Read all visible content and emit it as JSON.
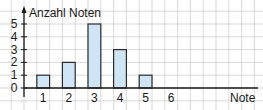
{
  "chart_data": {
    "type": "bar",
    "title": "",
    "xlabel": "Note",
    "ylabel": "Anzahl Noten",
    "categories": [
      "1",
      "2",
      "3",
      "4",
      "5",
      "6"
    ],
    "values": [
      1,
      2,
      5,
      3,
      1,
      0
    ],
    "ylim": [
      0,
      5
    ],
    "yticks": [
      "0",
      "1",
      "2",
      "3",
      "4",
      "5"
    ],
    "grid": true,
    "legend": null,
    "colors": {
      "bar_fill": "#cfe4f5",
      "bar_stroke": "#2b2b2b",
      "grid": "#cfcfcf",
      "axis": "#1a1a1a"
    }
  }
}
